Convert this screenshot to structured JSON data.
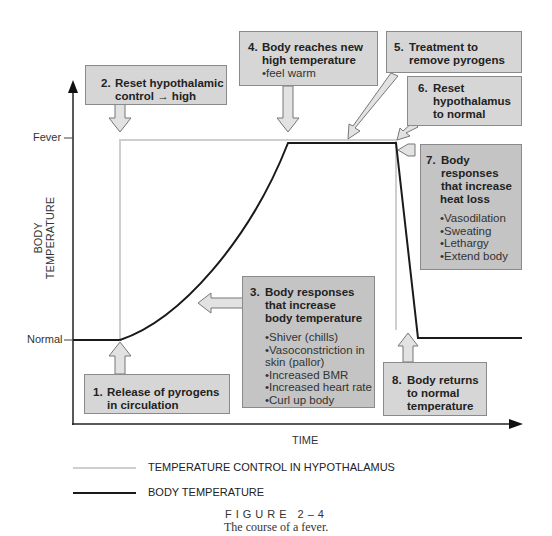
{
  "axes": {
    "y_label": "BODY TEMPERATURE",
    "x_label": "TIME",
    "y_ticks": [
      "Fever",
      "Normal"
    ]
  },
  "boxes": [
    {
      "num": "1.",
      "lines": [
        "Release of pyrogens",
        "in circulation"
      ],
      "bullets": []
    },
    {
      "num": "2.",
      "lines": [
        "Reset hypothalamic",
        "control → high"
      ],
      "bullets": []
    },
    {
      "num": "3.",
      "lines": [
        "Body responses",
        "that increase",
        "body temperature"
      ],
      "bullets": [
        "Shiver (chills)",
        "Vasoconstriction in skin (pallor)",
        "Increased BMR",
        "Increased heart rate",
        "Curl up body"
      ]
    },
    {
      "num": "4.",
      "lines": [
        "Body reaches new",
        "high temperature"
      ],
      "bullets": [
        "feel warm"
      ]
    },
    {
      "num": "5.",
      "lines": [
        "Treatment to",
        "remove pyrogens"
      ],
      "bullets": []
    },
    {
      "num": "6.",
      "lines": [
        "Reset",
        "hypothalamus",
        "to normal"
      ],
      "bullets": []
    },
    {
      "num": "7.",
      "lines": [
        "Body",
        "responses",
        "that increase",
        "heat loss"
      ],
      "bullets": [
        "Vasodilation",
        "Sweating",
        "Lethargy",
        "Extend body"
      ]
    },
    {
      "num": "8.",
      "lines": [
        "Body returns",
        "to normal",
        "temperature"
      ],
      "bullets": []
    }
  ],
  "legend": [
    {
      "label": "TEMPERATURE CONTROL IN HYPOTHALAMUS",
      "color": "#c8c8c8"
    },
    {
      "label": "BODY TEMPERATURE",
      "color": "#1a1a1a"
    }
  ],
  "figure": {
    "label": "FIGURE 2–4",
    "caption": "The course of a fever."
  },
  "colors": {
    "box_fill": "#d6d6d6",
    "box_fill_dark": "#c4c4c4",
    "hypothalamus_line": "#c8c8c8",
    "body_line": "#1a1a1a"
  }
}
